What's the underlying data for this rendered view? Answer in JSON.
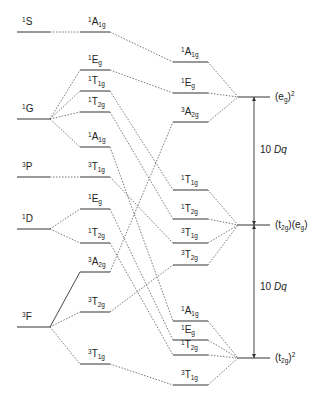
{
  "free_ion_terms": [
    {
      "id": "1S",
      "mult": "1",
      "sym": "S",
      "y": 32
    },
    {
      "id": "1G",
      "mult": "1",
      "sym": "G",
      "y": 119
    },
    {
      "id": "3P",
      "mult": "3",
      "sym": "P",
      "y": 177
    },
    {
      "id": "1D",
      "mult": "1",
      "sym": "D",
      "y": 229
    },
    {
      "id": "3F",
      "mult": "3",
      "sym": "F",
      "y": 327
    }
  ],
  "weak_field_states": [
    {
      "id": "L1",
      "mult": "1",
      "sym": "A",
      "sub": "1g",
      "y": 32,
      "parent": "1S"
    },
    {
      "id": "L2",
      "mult": "1",
      "sym": "E",
      "sub": "g",
      "y": 70,
      "parent": "1G"
    },
    {
      "id": "L3",
      "mult": "1",
      "sym": "T",
      "sub": "1g",
      "y": 91,
      "parent": "1G"
    },
    {
      "id": "L4",
      "mult": "1",
      "sym": "T",
      "sub": "2g",
      "y": 112,
      "parent": "1G"
    },
    {
      "id": "L5",
      "mult": "1",
      "sym": "A",
      "sub": "1g",
      "y": 147,
      "parent": "1G"
    },
    {
      "id": "L6",
      "mult": "3",
      "sym": "T",
      "sub": "1g",
      "y": 177,
      "parent": "3P"
    },
    {
      "id": "L7",
      "mult": "1",
      "sym": "E",
      "sub": "g",
      "y": 209,
      "parent": "1D"
    },
    {
      "id": "L8",
      "mult": "1",
      "sym": "T",
      "sub": "2g",
      "y": 243,
      "parent": "1D"
    },
    {
      "id": "L9",
      "mult": "3",
      "sym": "A",
      "sub": "2g",
      "y": 272,
      "parent": "3F",
      "solid": true
    },
    {
      "id": "L10",
      "mult": "3",
      "sym": "T",
      "sub": "2g",
      "y": 312,
      "parent": "3F"
    },
    {
      "id": "L11",
      "mult": "3",
      "sym": "T",
      "sub": "1g",
      "y": 364,
      "parent": "3F"
    }
  ],
  "strong_field_states": [
    {
      "id": "R1",
      "mult": "1",
      "sym": "A",
      "sub": "1g",
      "y": 62,
      "from": "L1",
      "config": "eg2"
    },
    {
      "id": "R2",
      "mult": "1",
      "sym": "E",
      "sub": "g",
      "y": 93,
      "from": "L2",
      "config": "eg2"
    },
    {
      "id": "R3",
      "mult": "3",
      "sym": "A",
      "sub": "2g",
      "y": 122,
      "from": "L9",
      "config": "eg2"
    },
    {
      "id": "R4",
      "mult": "1",
      "sym": "T",
      "sub": "1g",
      "y": 190,
      "from": "L3",
      "config": "t2geg"
    },
    {
      "id": "R5",
      "mult": "1",
      "sym": "T",
      "sub": "2g",
      "y": 219,
      "from": "L4",
      "config": "t2geg"
    },
    {
      "id": "R6",
      "mult": "3",
      "sym": "T",
      "sub": "1g",
      "y": 243,
      "from": "L6",
      "config": "t2geg"
    },
    {
      "id": "R7",
      "mult": "3",
      "sym": "T",
      "sub": "2g",
      "y": 265,
      "from": "L10",
      "config": "t2geg"
    },
    {
      "id": "R8",
      "mult": "1",
      "sym": "A",
      "sub": "1g",
      "y": 321,
      "from": "L5",
      "config": "t2g2"
    },
    {
      "id": "R9",
      "mult": "1",
      "sym": "E",
      "sub": "g",
      "y": 340,
      "from": "L7",
      "config": "t2g2"
    },
    {
      "id": "R10",
      "mult": "1",
      "sym": "T",
      "sub": "2g",
      "y": 355,
      "from": "L8",
      "config": "t2g2"
    },
    {
      "id": "R11",
      "mult": "3",
      "sym": "T",
      "sub": "1g",
      "y": 385,
      "from": "L11",
      "config": "t2g2"
    }
  ],
  "configurations": [
    {
      "id": "eg2",
      "label_parts": [
        "(e",
        "g",
        ")",
        "2"
      ],
      "text": "(eg)2",
      "y": 97
    },
    {
      "id": "t2geg",
      "label_parts": [
        "(t",
        "2g",
        ")(e",
        "g",
        ")"
      ],
      "text": "(t2g)(eg)",
      "y": 225
    },
    {
      "id": "t2g2",
      "label_parts": [
        "(t",
        "2g",
        ")",
        "2"
      ],
      "text": "(t2g)2",
      "y": 358
    }
  ],
  "energy_gaps": [
    {
      "label_num": "10 ",
      "label_var": "Dq",
      "from": "eg2",
      "to": "t2geg",
      "label_y": 153
    },
    {
      "label_num": "10 ",
      "label_var": "Dq",
      "from": "t2geg",
      "to": "t2g2",
      "label_y": 290
    }
  ]
}
